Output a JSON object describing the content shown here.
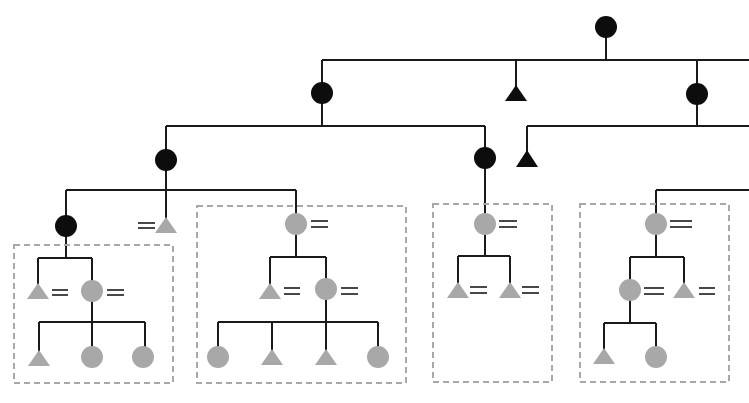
{
  "diagram": {
    "type": "kinship-genealogy-tree",
    "colors": {
      "line": "#1a1a1a",
      "ancestor_fill": "#0d0d0d",
      "descendant_fill": "#a8a8a8",
      "box_stroke": "#a8a8a8",
      "marriage_mark": "#1a1a1a"
    },
    "legend_semantics": {
      "circle": "female",
      "triangle": "male",
      "double-bar": "marriage / married",
      "dashed-box": "household / lineage group"
    },
    "nodes": [
      {
        "id": "root",
        "shape": "circle",
        "fill": "black"
      },
      {
        "id": "g1-left",
        "shape": "circle",
        "fill": "black"
      },
      {
        "id": "g1-mid",
        "shape": "triangle",
        "fill": "black"
      },
      {
        "id": "g1-right",
        "shape": "circle",
        "fill": "black"
      },
      {
        "id": "g2-a",
        "shape": "circle",
        "fill": "black"
      },
      {
        "id": "g2-b",
        "shape": "circle",
        "fill": "black"
      },
      {
        "id": "g2-c",
        "shape": "triangle",
        "fill": "black"
      },
      {
        "id": "g3-a",
        "shape": "circle",
        "fill": "black"
      },
      {
        "id": "g3-b",
        "shape": "triangle",
        "fill": "gray",
        "married": true
      },
      {
        "id": "g3-c",
        "shape": "circle",
        "fill": "gray",
        "married": true
      },
      {
        "id": "box1",
        "members": 5
      },
      {
        "id": "box2",
        "members": 7
      },
      {
        "id": "box3",
        "members": 3
      },
      {
        "id": "box4",
        "members": 5
      }
    ]
  }
}
